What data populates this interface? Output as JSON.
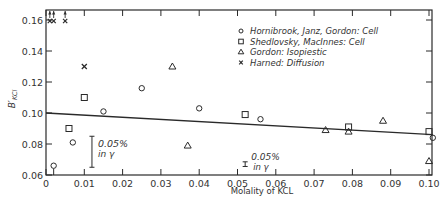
{
  "chart_data": {
    "type": "scatter",
    "title": "",
    "xlabel": "Molality of KCL",
    "ylabel": "B'KCl",
    "xlim": [
      0,
      0.101
    ],
    "ylim": [
      0.06,
      0.167
    ],
    "xticks": [
      "0",
      "0.01",
      "0.02",
      "0.03",
      "0.04",
      "0.05",
      "0.06",
      "0.07",
      "0.08",
      "0.09",
      "0.10"
    ],
    "xtick_values": [
      0,
      0.01,
      0.02,
      0.03,
      0.04,
      0.05,
      0.06,
      0.07,
      0.08,
      0.09,
      0.1
    ],
    "yticks": [
      "0.06",
      "0.08",
      "0.10",
      "0.12",
      "0.14",
      "0.16"
    ],
    "ytick_values": [
      0.06,
      0.08,
      0.1,
      0.12,
      0.14,
      0.16
    ],
    "grid": false,
    "legend_position": "upper right (inside)",
    "series": [
      {
        "name": "Hornibrook, Janz, Gordon: Cell",
        "marker": "circle",
        "points": [
          [
            0.002,
            0.066
          ],
          [
            0.007,
            0.081
          ],
          [
            0.015,
            0.101
          ],
          [
            0.025,
            0.116
          ],
          [
            0.04,
            0.103
          ],
          [
            0.056,
            0.096
          ],
          [
            0.101,
            0.084
          ]
        ]
      },
      {
        "name": "Shedlovsky, MacInnes: Cell",
        "marker": "square",
        "points": [
          [
            0.006,
            0.09
          ],
          [
            0.01,
            0.11
          ],
          [
            0.052,
            0.099
          ],
          [
            0.079,
            0.091
          ],
          [
            0.1,
            0.088
          ]
        ]
      },
      {
        "name": "Gordon: Isopiestic",
        "marker": "triangle",
        "points": [
          [
            0.033,
            0.13
          ],
          [
            0.037,
            0.079
          ],
          [
            0.073,
            0.089
          ],
          [
            0.079,
            0.088
          ],
          [
            0.088,
            0.095
          ],
          [
            0.1,
            0.069
          ]
        ]
      },
      {
        "name": "Harned: Diffusion",
        "marker": "x",
        "points": [
          [
            0.01,
            0.13
          ]
        ],
        "off_scale_points_above": [
          0.001,
          0.002,
          0.005
        ]
      }
    ],
    "fit_line": {
      "x": [
        0,
        0.101
      ],
      "y": [
        0.1,
        0.086
      ]
    },
    "annotations": [
      {
        "text_line1": "0.05%",
        "text_line2": "in γ",
        "error_bar_x": 0.012,
        "error_bar_y": [
          0.065,
          0.085
        ]
      },
      {
        "text_line1": "0.05%",
        "text_line2": "in γ",
        "error_bar_x": 0.052,
        "error_bar_y": [
          0.0655,
          0.0685
        ]
      }
    ]
  }
}
